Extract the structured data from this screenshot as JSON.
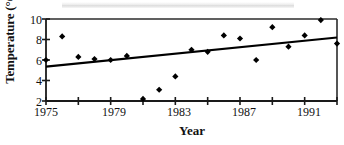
{
  "chart_data": {
    "type": "scatter",
    "title": "",
    "xlabel": "Year",
    "ylabel": "Temperature (°C)",
    "xlim": [
      1975,
      1993
    ],
    "ylim": [
      2,
      10
    ],
    "xticks": [
      1975,
      1977,
      1979,
      1981,
      1983,
      1985,
      1987,
      1989,
      1991,
      1993
    ],
    "xtick_labels": [
      "1975",
      "",
      "1979",
      "",
      "1983",
      "",
      "1987",
      "",
      "1991",
      ""
    ],
    "yticks": [
      2,
      4,
      6,
      8,
      10
    ],
    "ytick_labels": [
      "2",
      "4",
      "6",
      "8",
      "10"
    ],
    "grid": false,
    "legend": "none",
    "marker": "diamond",
    "marker_color": "#000000",
    "line_color": "#000000",
    "x": [
      1975,
      1976,
      1977,
      1978,
      1979,
      1980,
      1981,
      1982,
      1983,
      1984,
      1985,
      1986,
      1987,
      1988,
      1989,
      1990,
      1991,
      1992,
      1993
    ],
    "values": [
      6.0,
      8.3,
      6.3,
      6.1,
      6.0,
      6.4,
      2.2,
      3.1,
      4.4,
      7.0,
      6.8,
      8.4,
      8.1,
      6.0,
      9.2,
      7.3,
      8.4,
      9.9,
      7.6
    ],
    "series": [
      {
        "name": "Temperature",
        "type": "scatter",
        "values": [
          6.0,
          8.3,
          6.3,
          6.1,
          6.0,
          6.4,
          2.2,
          3.1,
          4.4,
          7.0,
          6.8,
          8.4,
          8.1,
          6.0,
          9.2,
          7.3,
          8.4,
          9.9,
          7.6
        ]
      },
      {
        "name": "Trend line",
        "type": "line",
        "x": [
          1975,
          1993
        ],
        "values": [
          5.35,
          8.2
        ]
      }
    ],
    "annotations": []
  },
  "axes": {
    "y_title": "Temperature (°C)",
    "x_title": "Year",
    "y_tick_labels": [
      "2",
      "4",
      "6",
      "8",
      "10"
    ],
    "x_tick_labels": [
      "1975",
      "1979",
      "1983",
      "1987",
      "1991"
    ]
  },
  "colors": {
    "ink": "#111111",
    "marker": "#000000",
    "frame": "#2b2b2b"
  }
}
